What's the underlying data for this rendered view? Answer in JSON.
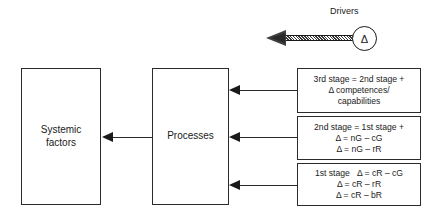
{
  "diagram": {
    "title": "",
    "nodes": {
      "systemic_factors": {
        "line1": "Systemic",
        "line2": "factors"
      },
      "processes": {
        "label": "Processes"
      },
      "stage3": {
        "line1": "3rd stage = 2nd stage +",
        "line2": "Δ competences/",
        "line3": "capabilities"
      },
      "stage2": {
        "line1": "2nd stage = 1st stage +",
        "line2": "Δ = nG – cG",
        "line3": "Δ = nG – rR"
      },
      "stage1": {
        "line1": "1st stage   Δ = cR – cG",
        "line2": "Δ = cR – rR",
        "line3": "Δ = cR – bR"
      }
    },
    "drivers": {
      "label": "Drivers",
      "symbol": "Δ"
    },
    "colors": {
      "stroke": "#2b2b2b",
      "arrow": "#1a1a1a",
      "background": "#ffffff",
      "driver_shaft": "#555555"
    }
  }
}
